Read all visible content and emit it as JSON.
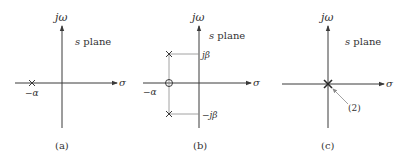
{
  "panels": [
    {
      "id": "a",
      "caption": "(a)",
      "plane_label_var": "s",
      "plane_label_word": " plane",
      "y_axis_label": "jω",
      "x_axis_label": "σ",
      "poles": [
        {
          "label": "−α"
        }
      ]
    },
    {
      "id": "b",
      "caption": "(b)",
      "plane_label_var": "s",
      "plane_label_word": " plane",
      "y_axis_label": "jω",
      "x_axis_label": "σ",
      "poles": [
        {
          "label": "jβ"
        },
        {
          "label": "−jβ"
        }
      ],
      "zero": {
        "label": "−α"
      }
    },
    {
      "id": "c",
      "caption": "(c)",
      "plane_label_var": "s",
      "plane_label_word": " plane",
      "y_axis_label": "jω",
      "x_axis_label": "σ",
      "double_pole_label": "(2)"
    }
  ]
}
